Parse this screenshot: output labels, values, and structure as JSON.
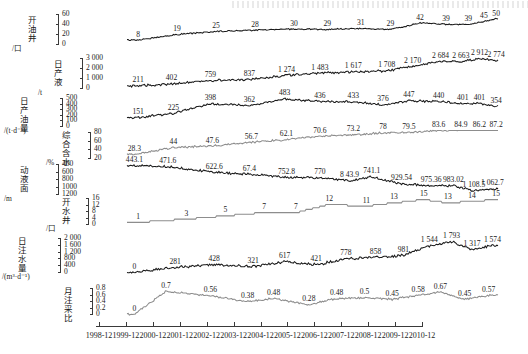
{
  "figure": {
    "title": "",
    "x_axis": {
      "tick_labels": [
        "1998-12",
        "1999-12",
        "2000-12",
        "2001-12",
        "2002-12",
        "2003-12",
        "2004-12",
        "2005-12",
        "2006-12",
        "2007-12",
        "2008-12",
        "2009-12",
        "2010-12"
      ]
    },
    "colors": {
      "dark_series": "#1b1b1b",
      "grey_series": "#8d8d8d",
      "axis": "#3a3a3a"
    }
  },
  "chart_data": [
    {
      "type": "line",
      "id": "open-oil-wells",
      "ylabel": "开油井",
      "yunit": "/口",
      "ylim": [
        0,
        60
      ],
      "yticks": [
        0,
        20,
        40,
        60
      ],
      "ytick_labels": [
        "0",
        "20",
        "40",
        "60"
      ],
      "inverted": false,
      "series_color": "dark",
      "annotations": [
        {
          "label": "8",
          "x": 0.03,
          "v": 8
        },
        {
          "label": "19",
          "x": 0.135,
          "v": 19
        },
        {
          "label": "25",
          "x": 0.24,
          "v": 25
        },
        {
          "label": "28",
          "x": 0.345,
          "v": 28
        },
        {
          "label": "30",
          "x": 0.45,
          "v": 30
        },
        {
          "label": "29",
          "x": 0.54,
          "v": 29
        },
        {
          "label": "31",
          "x": 0.63,
          "v": 31
        },
        {
          "label": "29",
          "x": 0.71,
          "v": 29
        },
        {
          "label": "42",
          "x": 0.79,
          "v": 42
        },
        {
          "label": "39",
          "x": 0.86,
          "v": 39
        },
        {
          "label": "39",
          "x": 0.92,
          "v": 39
        },
        {
          "label": "45",
          "x": 0.962,
          "v": 45
        },
        {
          "label": "50",
          "x": 0.995,
          "v": 50
        }
      ]
    },
    {
      "type": "line",
      "id": "daily-liquid-production",
      "ylabel": "日产液",
      "yunit": "/t",
      "ylim": [
        0,
        3000
      ],
      "yticks": [
        0,
        1000,
        2000,
        3000
      ],
      "ytick_labels": [
        "0",
        "1 000",
        "2 000",
        "3 000"
      ],
      "inverted": false,
      "series_color": "dark",
      "annotations": [
        {
          "label": "211",
          "x": 0.03,
          "v": 211
        },
        {
          "label": "402",
          "x": 0.12,
          "v": 402
        },
        {
          "label": "759",
          "x": 0.225,
          "v": 759
        },
        {
          "label": "837",
          "x": 0.33,
          "v": 837
        },
        {
          "label": "1 274",
          "x": 0.43,
          "v": 1274
        },
        {
          "label": "1 483",
          "x": 0.52,
          "v": 1483
        },
        {
          "label": "1 617",
          "x": 0.61,
          "v": 1617
        },
        {
          "label": "1 708",
          "x": 0.7,
          "v": 1708
        },
        {
          "label": "2 170",
          "x": 0.77,
          "v": 2170
        },
        {
          "label": "2 684",
          "x": 0.845,
          "v": 2684
        },
        {
          "label": "2 663",
          "x": 0.9,
          "v": 2663
        },
        {
          "label": "2 912",
          "x": 0.95,
          "v": 2912
        },
        {
          "label": "2 774",
          "x": 0.995,
          "v": 2774
        }
      ]
    },
    {
      "type": "line",
      "id": "daily-oil-production",
      "ylabel": "日产油量",
      "yunit": "/(t·d⁻¹)",
      "ylim": [
        0,
        500
      ],
      "yticks": [
        0,
        100,
        200,
        300,
        400,
        500
      ],
      "ytick_labels": [
        "0",
        "100",
        "200",
        "300",
        "400",
        "500"
      ],
      "inverted": false,
      "series_color": "dark",
      "annotations": [
        {
          "label": "151",
          "x": 0.03,
          "v": 151
        },
        {
          "label": "225",
          "x": 0.125,
          "v": 225
        },
        {
          "label": "398",
          "x": 0.225,
          "v": 398
        },
        {
          "label": "362",
          "x": 0.33,
          "v": 362
        },
        {
          "label": "483",
          "x": 0.425,
          "v": 483
        },
        {
          "label": "436",
          "x": 0.52,
          "v": 436
        },
        {
          "label": "433",
          "x": 0.61,
          "v": 433
        },
        {
          "label": "376",
          "x": 0.69,
          "v": 376
        },
        {
          "label": "447",
          "x": 0.76,
          "v": 447
        },
        {
          "label": "440",
          "x": 0.84,
          "v": 440
        },
        {
          "label": "401",
          "x": 0.905,
          "v": 401
        },
        {
          "label": "401",
          "x": 0.95,
          "v": 401
        },
        {
          "label": "354",
          "x": 0.995,
          "v": 354
        }
      ]
    },
    {
      "type": "line",
      "id": "water-cut",
      "ylabel": "综合含水",
      "yunit": "/%",
      "ylim": [
        20,
        80
      ],
      "yticks": [
        20,
        40,
        60,
        80
      ],
      "ytick_labels": [
        "20",
        "40",
        "60",
        "80"
      ],
      "inverted": false,
      "series_color": "grey",
      "annotations": [
        {
          "label": "28.3",
          "x": 0.02,
          "v": 28.3
        },
        {
          "label": "44",
          "x": 0.125,
          "v": 44
        },
        {
          "label": "47.6",
          "x": 0.23,
          "v": 47.6
        },
        {
          "label": "56.7",
          "x": 0.335,
          "v": 56.7
        },
        {
          "label": "62.1",
          "x": 0.43,
          "v": 62.1
        },
        {
          "label": "70.6",
          "x": 0.52,
          "v": 70.6
        },
        {
          "label": "73.2",
          "x": 0.61,
          "v": 73.2
        },
        {
          "label": "78",
          "x": 0.69,
          "v": 78
        },
        {
          "label": "79.5",
          "x": 0.76,
          "v": 79.5
        },
        {
          "label": "83.6",
          "x": 0.84,
          "v": 83.6
        },
        {
          "label": "84.9",
          "x": 0.9,
          "v": 84.9
        },
        {
          "label": "86.2",
          "x": 0.95,
          "v": 86.2
        },
        {
          "label": "87.2",
          "x": 0.995,
          "v": 87.2
        }
      ]
    },
    {
      "type": "line",
      "id": "dynamic-fluid-level",
      "ylabel": "动液面",
      "yunit": "/m",
      "ylim": [
        400,
        1200
      ],
      "yticks": [
        400,
        600,
        800,
        1000,
        1200
      ],
      "ytick_labels": [
        "400",
        "600",
        "800",
        "1000",
        "1200"
      ],
      "inverted": true,
      "series_color": "dark",
      "annotations": [
        {
          "label": "443.1",
          "x": 0.02,
          "v": 443.1
        },
        {
          "label": "471.6",
          "x": 0.11,
          "v": 471.6
        },
        {
          "label": "622.6",
          "x": 0.235,
          "v": 622.6
        },
        {
          "label": "67.4",
          "x": 0.33,
          "v": 674
        },
        {
          "label": "752.8",
          "x": 0.43,
          "v": 752.8
        },
        {
          "label": "770",
          "x": 0.52,
          "v": 770
        },
        {
          "label": "8 43.9",
          "x": 0.6,
          "v": 843.9
        },
        {
          "label": "741.1",
          "x": 0.66,
          "v": 741.1
        },
        {
          "label": "929.54",
          "x": 0.74,
          "v": 929.54
        },
        {
          "label": "975.36",
          "x": 0.82,
          "v": 975.36
        },
        {
          "label": "983.02",
          "x": 0.88,
          "v": 983.02
        },
        {
          "label": "1 108.5",
          "x": 0.935,
          "v": 1108.5
        },
        {
          "label": "1 062.7",
          "x": 0.985,
          "v": 1062.7
        }
      ]
    },
    {
      "type": "line",
      "id": "open-water-wells",
      "ylabel": "开水井",
      "yunit": "/口",
      "ylim": [
        0,
        16
      ],
      "yticks": [
        0,
        4,
        8,
        12,
        16
      ],
      "ytick_labels": [
        "0",
        "4",
        "8",
        "12",
        "16"
      ],
      "inverted": false,
      "series_color": "grey",
      "annotations": [
        {
          "label": "1",
          "x": 0.03,
          "v": 1
        },
        {
          "label": "3",
          "x": 0.16,
          "v": 3
        },
        {
          "label": "5",
          "x": 0.265,
          "v": 5
        },
        {
          "label": "7",
          "x": 0.37,
          "v": 7
        },
        {
          "label": "7",
          "x": 0.455,
          "v": 7
        },
        {
          "label": "12",
          "x": 0.545,
          "v": 12
        },
        {
          "label": "11",
          "x": 0.645,
          "v": 11
        },
        {
          "label": "13",
          "x": 0.72,
          "v": 13
        },
        {
          "label": "15",
          "x": 0.8,
          "v": 15
        },
        {
          "label": "13",
          "x": 0.865,
          "v": 13
        },
        {
          "label": "14",
          "x": 0.93,
          "v": 14
        },
        {
          "label": "15",
          "x": 0.995,
          "v": 15
        }
      ]
    },
    {
      "type": "line",
      "id": "daily-water-injection",
      "ylabel": "日注水量",
      "yunit": "/(m³·d⁻¹)",
      "ylim": [
        0,
        2000
      ],
      "yticks": [
        0,
        400,
        800,
        1200,
        1600,
        2000
      ],
      "ytick_labels": [
        "0",
        "400",
        "800",
        "1 200",
        "1 600",
        "2 000"
      ],
      "inverted": false,
      "series_color": "dark",
      "annotations": [
        {
          "label": "0",
          "x": 0.02,
          "v": 0
        },
        {
          "label": "281",
          "x": 0.13,
          "v": 281
        },
        {
          "label": "428",
          "x": 0.235,
          "v": 428
        },
        {
          "label": "321",
          "x": 0.34,
          "v": 321
        },
        {
          "label": "617",
          "x": 0.425,
          "v": 617
        },
        {
          "label": "421",
          "x": 0.51,
          "v": 421
        },
        {
          "label": "778",
          "x": 0.59,
          "v": 778
        },
        {
          "label": "858",
          "x": 0.67,
          "v": 858
        },
        {
          "label": "981",
          "x": 0.745,
          "v": 981
        },
        {
          "label": "1 544",
          "x": 0.815,
          "v": 1544
        },
        {
          "label": "1 793",
          "x": 0.875,
          "v": 1793
        },
        {
          "label": "1 317",
          "x": 0.93,
          "v": 1317
        },
        {
          "label": "1 574",
          "x": 0.985,
          "v": 1574
        }
      ]
    },
    {
      "type": "line",
      "id": "monthly-injection-production-ratio",
      "ylabel": "月注采比",
      "yunit": "",
      "ylim": [
        0,
        0.8
      ],
      "yticks": [
        0,
        0.2,
        0.4,
        0.6,
        0.8
      ],
      "ytick_labels": [
        "0",
        "0.2",
        "0.4",
        "0.6",
        "0.8"
      ],
      "inverted": false,
      "series_color": "grey",
      "annotations": [
        {
          "label": "0",
          "x": 0.02,
          "v": 0
        },
        {
          "label": "0.7",
          "x": 0.105,
          "v": 0.7
        },
        {
          "label": "0.56",
          "x": 0.225,
          "v": 0.56
        },
        {
          "label": "0.38",
          "x": 0.325,
          "v": 0.38
        },
        {
          "label": "0.48",
          "x": 0.395,
          "v": 0.48
        },
        {
          "label": "0.28",
          "x": 0.49,
          "v": 0.28
        },
        {
          "label": "0.48",
          "x": 0.565,
          "v": 0.48
        },
        {
          "label": "0.5",
          "x": 0.64,
          "v": 0.5
        },
        {
          "label": "0.45",
          "x": 0.715,
          "v": 0.45
        },
        {
          "label": "0.58",
          "x": 0.785,
          "v": 0.58
        },
        {
          "label": "0.67",
          "x": 0.845,
          "v": 0.67
        },
        {
          "label": "0.45",
          "x": 0.91,
          "v": 0.45
        },
        {
          "label": "0.57",
          "x": 0.975,
          "v": 0.57
        }
      ]
    }
  ]
}
